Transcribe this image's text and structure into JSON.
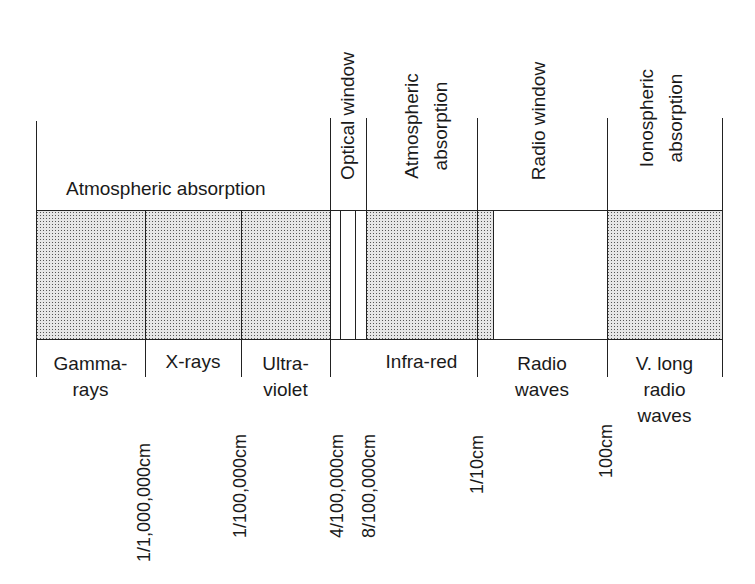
{
  "diagram": {
    "top_labels": {
      "atmospheric_absorption_left": "Atmospheric absorption",
      "optical_window": "Optical window",
      "atmospheric_absorption_ir_line1": "Atmospheric",
      "atmospheric_absorption_ir_line2": "absorption",
      "radio_window": "Radio window",
      "ionospheric_line1": "Ionospheric",
      "ionospheric_line2": "absorption"
    },
    "band_labels": {
      "gamma_line1": "Gamma-",
      "gamma_line2": "rays",
      "xrays": "X-rays",
      "uv_line1": "Ultra-",
      "uv_line2": "violet",
      "infrared": "Infra-red",
      "radio_line1": "Radio",
      "radio_line2": "waves",
      "vlong_line1": "V. long",
      "vlong_line2": "radio",
      "vlong_line3": "waves"
    },
    "wavelength_labels": {
      "gamma_xray": "1/1,000,000cm",
      "xray_uv": "1/100,000cm",
      "uv_optical": "4/100,000cm",
      "optical_ir": "8/100,000cm",
      "ir_radio": "1/10cm",
      "radio_vlong": "100cm"
    },
    "regions": [
      {
        "name": "Gamma-rays",
        "absorbed": true
      },
      {
        "name": "X-rays",
        "absorbed": true
      },
      {
        "name": "Ultra-violet",
        "absorbed": true
      },
      {
        "name": "Optical window",
        "absorbed": false
      },
      {
        "name": "Infra-red",
        "absorbed": true
      },
      {
        "name": "Radio waves",
        "absorbed": false
      },
      {
        "name": "V. long radio waves",
        "absorbed": true
      }
    ],
    "colors": {
      "line": "#222222",
      "shading": "#c8c8c8",
      "background": "#ffffff"
    }
  }
}
